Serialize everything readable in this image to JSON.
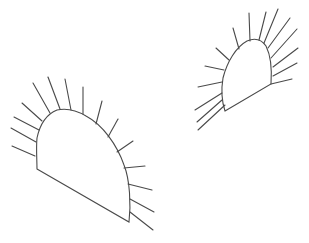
{
  "figure": {
    "stroke_color": "#4a4a4a",
    "background": "#ffffff"
  },
  "shapes": [
    {
      "name": "left-dome",
      "outline": "M37,169 L129,222 C131,205 130,180 124,165 C117,145 103,125 86,116 C76,110 66,108 57,110 C47,114 40,124 37,138 C36,148 37,160 37,169 Z",
      "rays": [
        [
          35,
          156,
          12,
          146
        ],
        [
          36,
          142,
          11,
          128
        ],
        [
          39,
          130,
          14,
          117
        ],
        [
          42,
          121,
          22,
          103
        ],
        [
          50,
          113,
          33,
          83
        ],
        [
          60,
          109,
          48,
          77
        ],
        [
          71,
          110,
          65,
          79
        ],
        [
          83,
          114,
          83,
          87
        ],
        [
          96,
          124,
          102,
          101
        ],
        [
          108,
          137,
          118,
          119
        ],
        [
          117,
          152,
          133,
          141
        ],
        [
          124,
          168,
          145,
          166
        ],
        [
          128,
          184,
          152,
          190
        ],
        [
          130,
          199,
          154,
          212
        ],
        [
          130,
          212,
          153,
          230
        ]
      ]
    },
    {
      "name": "right-dome",
      "outline": "M225,111 L271,84 C272,70 271,56 266,46 C261,39 254,38 247,41 C236,47 227,62 223,78 C221,90 222,102 225,111 Z",
      "rays": [
        [
          225,
          105,
          198,
          130
        ],
        [
          222,
          100,
          197,
          122
        ],
        [
          222,
          93,
          195,
          110
        ],
        [
          222,
          82,
          198,
          87
        ],
        [
          224,
          70,
          205,
          66
        ],
        [
          229,
          60,
          216,
          48
        ],
        [
          239,
          49,
          233,
          28
        ],
        [
          250,
          41,
          249,
          13
        ],
        [
          259,
          40,
          266,
          12
        ],
        [
          264,
          43,
          278,
          9
        ],
        [
          268,
          48,
          290,
          18
        ],
        [
          271,
          58,
          297,
          29
        ],
        [
          273,
          67,
          298,
          48
        ],
        [
          273,
          76,
          297,
          63
        ],
        [
          271,
          84,
          292,
          79
        ]
      ]
    }
  ]
}
